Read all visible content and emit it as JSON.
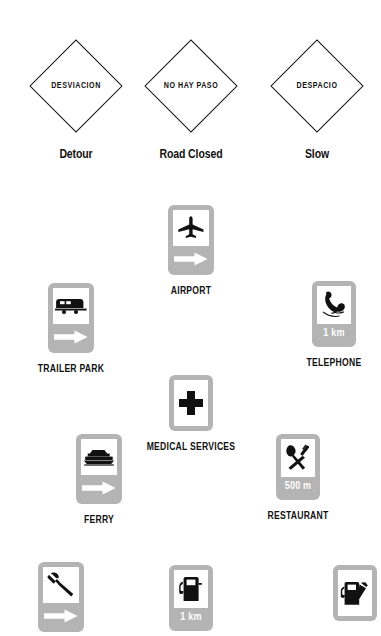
{
  "page": {
    "background_color": "#ffffff",
    "sign_gray": "#b4b4b4",
    "symbol_black": "#111111",
    "panel_white": "#ffffff"
  },
  "warning_signs": [
    {
      "id": "detour",
      "sign_text": "DESVIACION",
      "caption": "Detour",
      "shape": "diamond"
    },
    {
      "id": "road-closed",
      "sign_text": "NO HAY PASO",
      "caption": "Road Closed",
      "shape": "diamond"
    },
    {
      "id": "slow",
      "sign_text": "DESPACIO",
      "caption": "Slow",
      "shape": "diamond"
    }
  ],
  "service_signs": [
    {
      "id": "airport",
      "caption": "AIRPORT",
      "icon": "airplane-icon",
      "supplemental": "arrow-right",
      "distance": ""
    },
    {
      "id": "trailer-park",
      "caption": "TRAILER PARK",
      "icon": "trailer-caravan-icon",
      "supplemental": "arrow-right",
      "distance": ""
    },
    {
      "id": "telephone",
      "caption": "TELEPHONE",
      "icon": "telephone-handset-icon",
      "supplemental": "distance",
      "distance": "1 km"
    },
    {
      "id": "medical-services",
      "caption": "MEDICAL SERVICES",
      "icon": "medical-cross-icon",
      "supplemental": "none",
      "distance": ""
    },
    {
      "id": "ferry",
      "caption": "FERRY",
      "icon": "ferry-boat-icon",
      "supplemental": "arrow-right",
      "distance": ""
    },
    {
      "id": "restaurant",
      "caption": "RESTAURANT",
      "icon": "fork-knife-icon",
      "supplemental": "distance",
      "distance": "500 m"
    },
    {
      "id": "mechanic",
      "caption": "",
      "icon": "hammer-tool-icon",
      "supplemental": "arrow-right",
      "distance": ""
    },
    {
      "id": "gas-station-distance",
      "caption": "",
      "icon": "gas-pump-icon",
      "supplemental": "distance",
      "distance": "1 km"
    },
    {
      "id": "gas-station-nozzle",
      "caption": "",
      "icon": "gas-pump-nozzle-icon",
      "supplemental": "none",
      "distance": ""
    }
  ]
}
